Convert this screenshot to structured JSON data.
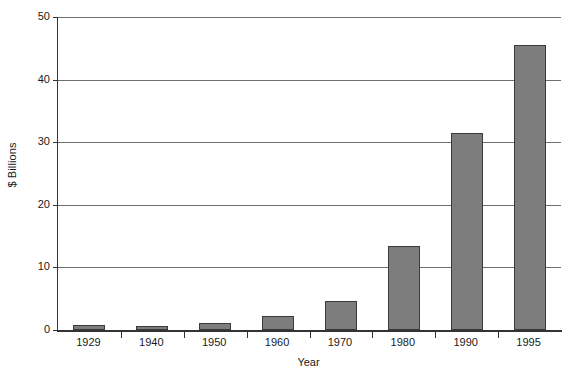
{
  "chart_data": {
    "type": "bar",
    "title": "",
    "xlabel": "Year",
    "ylabel": "$ Billions",
    "categories": [
      "1929",
      "1940",
      "1950",
      "1960",
      "1970",
      "1980",
      "1990",
      "1995"
    ],
    "values": [
      0.8,
      0.6,
      1.2,
      2.2,
      4.7,
      13.4,
      31.5,
      45.6
    ],
    "ylim": [
      0,
      50
    ],
    "ytick_labels": [
      "0",
      "10",
      "20",
      "30",
      "40",
      "50"
    ],
    "ytick_values": [
      0,
      10,
      20,
      30,
      40,
      50
    ],
    "grid": "horizontal",
    "legend": "none",
    "series": [
      {
        "name": "$ Billions",
        "values": [
          0.8,
          0.6,
          1.2,
          2.2,
          4.7,
          13.4,
          31.5,
          45.6
        ]
      }
    ],
    "colors": {
      "bar_fill": "#7d7d7d",
      "bar_border": "#3b3b3b",
      "gridline": "#6e6e6e",
      "axis": "#333333",
      "text": "#1a1a1a",
      "background": "#ffffff"
    }
  }
}
